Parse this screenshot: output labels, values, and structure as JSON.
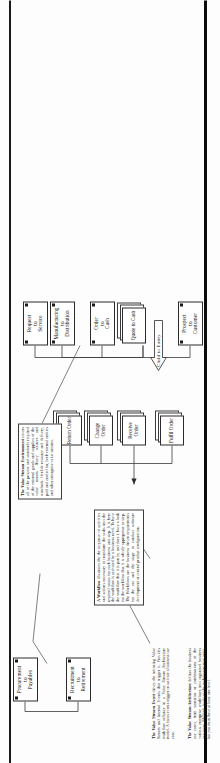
{
  "document": {
    "type": "value-stream-architecture-diagram",
    "orientation": "landscape-page-shown-rotated-90-ccw"
  },
  "nodes": {
    "procure_to_pay": {
      "label": "Procurement\nto\nPayables",
      "kind": "uml-value-stream"
    },
    "recruit_to_retire": {
      "label": "Recruitment\nto\nRetirement",
      "kind": "uml-value-stream"
    },
    "request_to_service": {
      "label": "Request\nto\nService",
      "kind": "uml-value-stream"
    },
    "manufacturing_to_dist": {
      "label": "Manufacturing\nto\nDistribution",
      "kind": "uml-value-stream"
    },
    "order_to_cash": {
      "label": "Order\nto\nCash",
      "kind": "uml-value-stream"
    },
    "quote_to_cash": {
      "label": "Quote\nto\nCash",
      "kind": "stacked-workflow"
    },
    "prospect_to_customer": {
      "label": "Prospect\nto\nCustomer",
      "kind": "uml-value-stream"
    },
    "fulfil_order": {
      "label": "Fulfil\nOrder",
      "kind": "stacked-workflow"
    },
    "receive_order": {
      "label": "Receive\nOrder",
      "kind": "stacked-workflow"
    },
    "change_order": {
      "label": "Change\nOrder",
      "kind": "stacked-workflow"
    },
    "return_order": {
      "label": "Return\nOrder",
      "kind": "stacked-workflow"
    }
  },
  "arrow": {
    "label": "Child to Entity",
    "shape": "block-arrow-up"
  },
  "notes": {
    "value_stream_environment": {
      "title": "The Value Stream Environment",
      "body": "covers all of the process and standards required of the external goods and supplies of the value stream. Heavy sources and standards: flexible resource and delivery, paid and crafted for, both external entities and other enterprise value streams."
    },
    "workflow": {
      "title": "A Workflow",
      "body": "illustrates the the sequence of activities and actions necessary to transform the tasks into the required status for each business unit step. It is here the workflow is activated by a business need. To have the workflow that it is part in, and does it have a look for the workflow that it is wholly appropriate to step. The Workflows are the business driven requirements for the use and the stage to conduct software development or control product configuration."
    },
    "value_stream_event": {
      "title": "The Value Stream Event",
      "body": "drives the initiating Value Stream and Internal Events that trigger it. Provides workflow reliance in a Value Stream Architecture model. A focus events trigger or activate a business use case."
    },
    "value_stream_architecture": {
      "title": "The Value Stream Architecture",
      "body": "defines the business use cases, from scenarios or combinations of the various enterprise workflows into organised business use cases. Multiple levels of the architecture may exist, but you must have at least one level."
    }
  }
}
